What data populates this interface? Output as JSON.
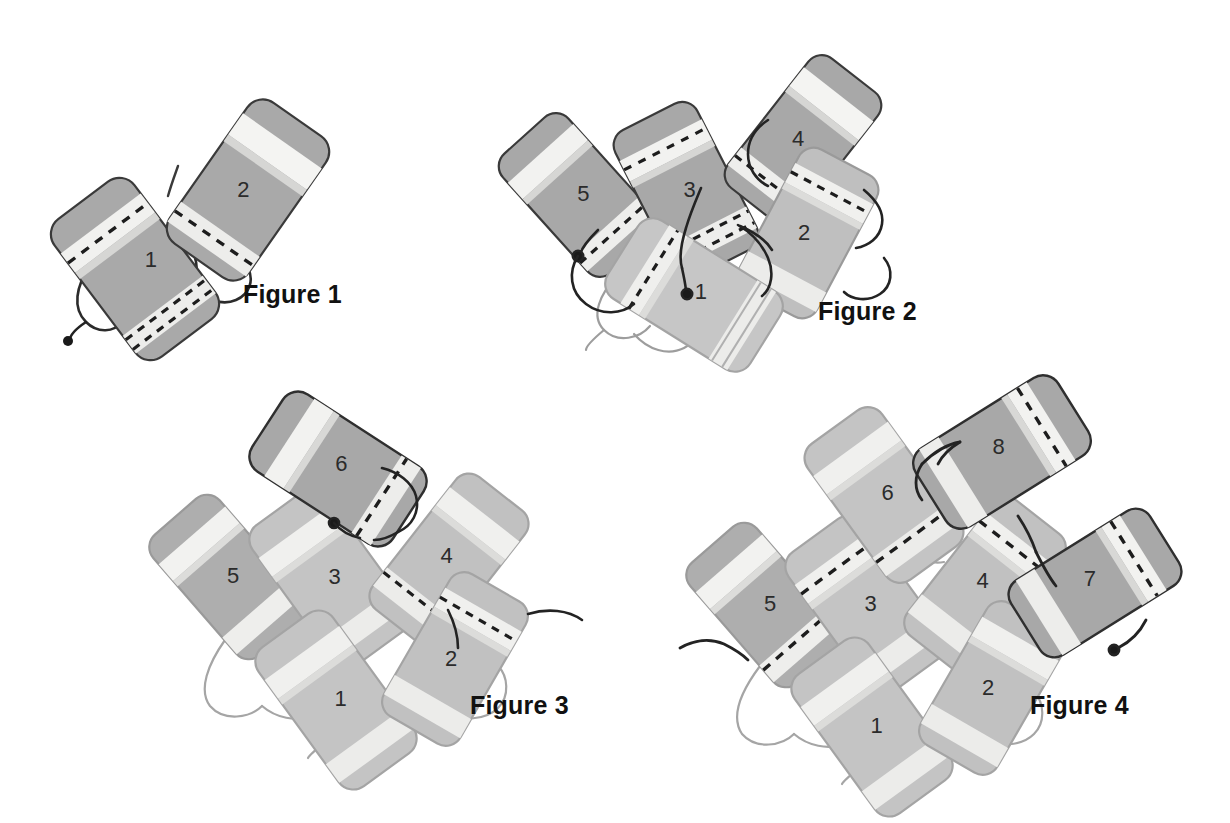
{
  "page": {
    "background_color": "#ffffff",
    "width": 1230,
    "height": 823
  },
  "palette": {
    "block_dark_fill": "#a8a8a8",
    "block_light_fill": "#bdbdbd",
    "block_pale_fill": "#c9c9c9",
    "stripe_light": "#f0f0ee",
    "stripe_mid": "#d8d8d6",
    "outline_dark": "#3a3a3a",
    "outline_light": "#9a9a9a",
    "dash_color": "#1d1d1d",
    "cord_dark": "#232323",
    "cord_light": "#9d9d9d",
    "text_color": "#111111",
    "number_color": "#2b2b2b"
  },
  "figures": [
    {
      "id": "figure-1",
      "caption": "Figure 1",
      "caption_x": 243,
      "caption_y": 303,
      "block_count": 2,
      "blocks": [
        {
          "label": "1",
          "shade": "dark",
          "outline": "dark"
        },
        {
          "label": "2",
          "shade": "dark",
          "outline": "dark"
        }
      ],
      "free_end_dot": true
    },
    {
      "id": "figure-2",
      "caption": "Figure 2",
      "caption_x": 818,
      "caption_y": 320,
      "block_count": 5,
      "blocks": [
        {
          "label": "1",
          "shade": "pale",
          "outline": "light"
        },
        {
          "label": "2",
          "shade": "light",
          "outline": "light"
        },
        {
          "label": "3",
          "shade": "dark",
          "outline": "dark"
        },
        {
          "label": "4",
          "shade": "dark",
          "outline": "dark"
        },
        {
          "label": "5",
          "shade": "dark",
          "outline": "dark"
        }
      ],
      "free_end_dot": true
    },
    {
      "id": "figure-3",
      "caption": "Figure 3",
      "caption_x": 470,
      "caption_y": 714,
      "block_count": 6,
      "blocks": [
        {
          "label": "1",
          "shade": "pale",
          "outline": "light"
        },
        {
          "label": "2",
          "shade": "light",
          "outline": "light"
        },
        {
          "label": "3",
          "shade": "pale",
          "outline": "light"
        },
        {
          "label": "4",
          "shade": "light",
          "outline": "light"
        },
        {
          "label": "5",
          "shade": "dark",
          "outline": "light"
        },
        {
          "label": "6",
          "shade": "dark",
          "outline": "dark"
        }
      ],
      "free_end_dot": true
    },
    {
      "id": "figure-4",
      "caption": "Figure 4",
      "caption_x": 1030,
      "caption_y": 714,
      "block_count": 8,
      "blocks": [
        {
          "label": "1",
          "shade": "pale",
          "outline": "light"
        },
        {
          "label": "2",
          "shade": "light",
          "outline": "light"
        },
        {
          "label": "3",
          "shade": "pale",
          "outline": "light"
        },
        {
          "label": "4",
          "shade": "light",
          "outline": "light"
        },
        {
          "label": "5",
          "shade": "dark",
          "outline": "light"
        },
        {
          "label": "6",
          "shade": "pale",
          "outline": "light"
        },
        {
          "label": "7",
          "shade": "dark",
          "outline": "dark"
        },
        {
          "label": "8",
          "shade": "dark",
          "outline": "dark"
        }
      ],
      "free_end_dot": true
    }
  ],
  "labels": {
    "fig1_caption": "Figure 1",
    "fig2_caption": "Figure 2",
    "fig3_caption": "Figure 3",
    "fig4_caption": "Figure 4",
    "f1_b1": "1",
    "f1_b2": "2",
    "f2_b1": "1",
    "f2_b2": "2",
    "f2_b3": "3",
    "f2_b4": "4",
    "f2_b5": "5",
    "f3_b1": "1",
    "f3_b2": "2",
    "f3_b3": "3",
    "f3_b4": "4",
    "f3_b5": "5",
    "f3_b6": "6",
    "f4_b1": "1",
    "f4_b2": "2",
    "f4_b3": "3",
    "f4_b4": "4",
    "f4_b5": "5",
    "f4_b6": "6",
    "f4_b7": "7",
    "f4_b8": "8"
  }
}
